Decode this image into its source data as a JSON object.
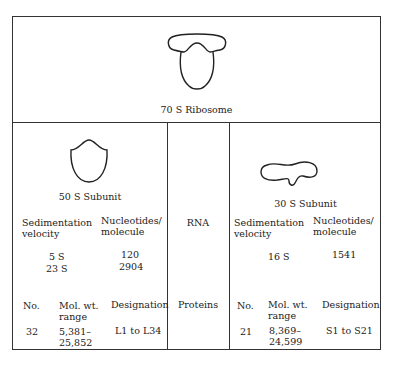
{
  "ribosome": {
    "label": "70 S Ribosome"
  },
  "middle": {
    "rna_label": "RNA",
    "proteins_label": "Proteins"
  },
  "subunit50": {
    "label": "50 S Subunit",
    "rna_headers": [
      "Sedimentation velocity",
      "Nucleotides/ molecule"
    ],
    "rna_header_lines": {
      "sed1": "Sedimentation",
      "sed2": "velocity",
      "nuc1": "Nucleotides/",
      "nuc2": "molecule"
    },
    "rna_rows": [
      {
        "sed": "5 S",
        "nuc": "120"
      },
      {
        "sed": "23 S",
        "nuc": "2904"
      }
    ],
    "protein_headers": {
      "no": "No.",
      "mw1": "Mol. wt.",
      "mw2": "range",
      "des": "Designation"
    },
    "protein_row": {
      "no": "32",
      "mw1": "5,381–",
      "mw2": "25,852",
      "des": "L1 to L34"
    }
  },
  "subunit30": {
    "label": "30 S Subunit",
    "rna_header_lines": {
      "sed1": "Sedimentation",
      "sed2": "velocity",
      "nuc1": "Nucleotides/",
      "nuc2": "molecule"
    },
    "rna_rows": [
      {
        "sed": "16 S",
        "nuc": "1541"
      }
    ],
    "protein_headers": {
      "no": "No.",
      "mw1": "Mol. wt.",
      "mw2": "range",
      "des": "Designation"
    },
    "protein_row": {
      "no": "21",
      "mw1": "8,369–",
      "mw2": "24,599",
      "des": "S1 to S21"
    }
  }
}
